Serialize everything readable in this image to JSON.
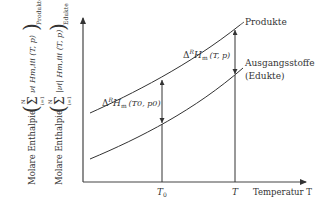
{
  "diagram": {
    "type": "enthalpy-temperature diagram",
    "y_axis_label_products": {
      "prefix": "Molare Enthalpie",
      "formula": "(Σ νi Hm,i (T, p))",
      "sum_upper": "N",
      "sum_lower": "i=1",
      "body": "νi Hm,iii (T, p)",
      "subscript": "Produkte"
    },
    "y_axis_label_educts": {
      "prefix": "Molare Enthalpie",
      "sum_upper": "N",
      "sum_lower": "i=1",
      "body": "|νi| Hm,iii (T, p)",
      "subscript": "Edukte"
    },
    "x_axis_label": "Temperatur T",
    "x_ticks": [
      "T0",
      "T"
    ],
    "curves": [
      {
        "name": "Produkte",
        "label": "Produkte"
      },
      {
        "name": "Ausgangsstoffe",
        "label_line1": "Ausgangsstoffe",
        "label_line2": "(Edukte)"
      }
    ],
    "annotations": {
      "delta_T0": {
        "main": "Δ",
        "sup": "R",
        "h": "H",
        "sub": "m",
        "args": "(T0, p0)"
      },
      "delta_T": {
        "main": "Δ",
        "sup": "R",
        "h": "H",
        "sub": "m",
        "args": "(T, p)"
      }
    }
  },
  "text": {
    "molare": "Molare Enthalpie",
    "produkte": "Produkte",
    "edukte": "Edukte",
    "ausgang1": "Ausgangsstoffe",
    "ausgang2": "(Edukte)",
    "temperatur": "Temperatur T",
    "t0": "T",
    "t0sub": "0",
    "t": "T",
    "sum": "Σ",
    "N": "N",
    "i1": "i=1",
    "prodBody": "νi Hm,iii (T, p)",
    "eduBody": "|νi| Hm,iii (T, p)",
    "delta": "Δ",
    "R": "R",
    "H": "H",
    "m": "m",
    "argsT0": "(T0, p0)",
    "argsT": "(T, p)"
  }
}
